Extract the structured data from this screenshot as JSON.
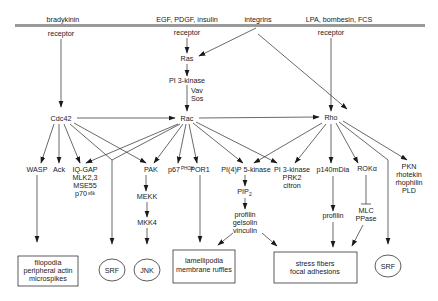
{
  "membrane": {
    "color": "#9a9a9a"
  },
  "ligands": {
    "bradykinin": "bradykinin",
    "growth_factors": "EGF, PDGF, insulin",
    "integrins": "integrins",
    "lpa": "LPA, bombesin, FCS"
  },
  "receptors": {
    "bradykinin_receptor": "receptor",
    "egf_receptor": "receptor",
    "lpa_receptor": "receptor"
  },
  "nodes": {
    "ras": "Ras",
    "pi3k_top": "PI 3-kinase",
    "vav": "Vav",
    "sos": "Sos",
    "cdc42": "Cdc42",
    "rac": "Rac",
    "rho": "Rho",
    "wasp": "WASP",
    "ack": "Ack",
    "iqgap": [
      "IQ-GAP",
      "MLK2,3",
      "MSE55",
      "p70"
    ],
    "p70_sup": "s6k",
    "pak": "PAK",
    "p67": "p67",
    "p67_sup": "PHOX",
    "por1": "POR1",
    "pi4p5k": "PI(4)P 5-kinase",
    "pi3k_group": [
      "PI 3-kinase",
      "PRK2",
      "citron"
    ],
    "p140mdia": "p140mDia",
    "rok": "ROKα",
    "pkn_group": [
      "PKN",
      "rhotekin",
      "rhophilin",
      "PLD"
    ],
    "mekk": "MEKK",
    "mkk4": "MKK4",
    "pip2": "PIP",
    "pip2_sub": "2",
    "profilin_group": [
      "profilin",
      "gelsolin",
      "vinculin"
    ],
    "profilin": "profilin",
    "mlc": [
      "MLC",
      "PPase"
    ]
  },
  "outcomes": {
    "filopodia": [
      "filopodia",
      "peripheral actin",
      "microspikes"
    ],
    "srf_left": "SRF",
    "jnk": "JNK",
    "lamellipodia": [
      "lamellipodia",
      "membrane ruffles"
    ],
    "stress_fibers": [
      "stress fibers",
      "focal adhesions"
    ],
    "srf_right": "SRF"
  }
}
